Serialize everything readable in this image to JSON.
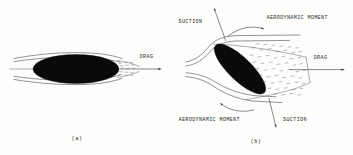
{
  "figure": {
    "title_present": false,
    "background_color": "#fdfdfc",
    "ink_color": "#2b2b2b",
    "body_color": "#0a0a0a",
    "panels": [
      {
        "id": "a",
        "caption": "(a)",
        "description": "streamlined body with attached flow and thin wake",
        "labels": [
          {
            "name": "drag",
            "text": "DRAG"
          }
        ]
      },
      {
        "id": "b",
        "caption": "(b)",
        "description": "inclined stalled body with large separated turbulent wake",
        "labels": [
          {
            "name": "suction-top",
            "text": "SUCTION"
          },
          {
            "name": "aerodynamic-moment-top",
            "text": "AERODYNAMIC MOMENT"
          },
          {
            "name": "drag",
            "text": "DRAG"
          },
          {
            "name": "aerodynamic-moment-bottom",
            "text": "AERODYNAMIC MOMENT"
          },
          {
            "name": "suction-bottom",
            "text": "SUCTION"
          }
        ]
      }
    ]
  }
}
